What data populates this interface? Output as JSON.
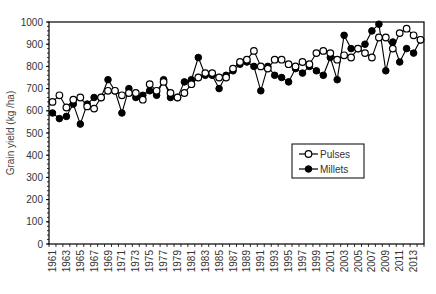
{
  "chart_data": {
    "type": "line",
    "title": "",
    "xlabel": "",
    "ylabel": "Grain yield (kg /ha)",
    "ylim": [
      0,
      1000
    ],
    "yticks": [
      0,
      100,
      200,
      300,
      400,
      500,
      600,
      700,
      800,
      900,
      1000
    ],
    "xtick_labels": [
      "1961",
      "1963",
      "1965",
      "1967",
      "1969",
      "1971",
      "1973",
      "1975",
      "1977",
      "1979",
      "1981",
      "1983",
      "1985",
      "1987",
      "1989",
      "1991",
      "1993",
      "1995",
      "1997",
      "1999",
      "2001",
      "2003",
      "2005",
      "2007",
      "2009",
      "2011",
      "2013"
    ],
    "grid": false,
    "legend_position": "inside-right",
    "x": [
      1961,
      1962,
      1963,
      1964,
      1965,
      1966,
      1967,
      1968,
      1969,
      1970,
      1971,
      1972,
      1973,
      1974,
      1975,
      1976,
      1977,
      1978,
      1979,
      1980,
      1981,
      1982,
      1983,
      1984,
      1985,
      1986,
      1987,
      1988,
      1989,
      1990,
      1991,
      1992,
      1993,
      1994,
      1995,
      1996,
      1997,
      1998,
      1999,
      2000,
      2001,
      2002,
      2003,
      2004,
      2005,
      2006,
      2007,
      2008,
      2009,
      2010,
      2011,
      2012,
      2013,
      2014
    ],
    "series": [
      {
        "name": "Pulses",
        "marker": "open-circle",
        "values": [
          640,
          670,
          615,
          650,
          660,
          620,
          610,
          660,
          690,
          690,
          670,
          680,
          680,
          650,
          720,
          690,
          730,
          680,
          660,
          680,
          720,
          750,
          770,
          770,
          750,
          750,
          790,
          820,
          830,
          870,
          800,
          790,
          830,
          830,
          810,
          800,
          820,
          810,
          860,
          870,
          860,
          830,
          850,
          840,
          880,
          860,
          840,
          930,
          930,
          880,
          950,
          970,
          940,
          920
        ]
      },
      {
        "name": "Millets",
        "marker": "filled-circle",
        "values": [
          590,
          565,
          575,
          630,
          540,
          630,
          660,
          660,
          740,
          690,
          590,
          700,
          660,
          670,
          690,
          670,
          740,
          660,
          660,
          730,
          740,
          840,
          760,
          760,
          700,
          760,
          780,
          810,
          820,
          800,
          690,
          800,
          760,
          750,
          730,
          790,
          770,
          800,
          780,
          760,
          840,
          740,
          940,
          880,
          880,
          900,
          960,
          990,
          780,
          910,
          820,
          880,
          860,
          920
        ]
      }
    ]
  },
  "legend": {
    "items": [
      {
        "label": "Pulses"
      },
      {
        "label": "Millets"
      }
    ]
  },
  "colors": {
    "line": "#000000",
    "axis": "#000000",
    "text": "#333333"
  }
}
